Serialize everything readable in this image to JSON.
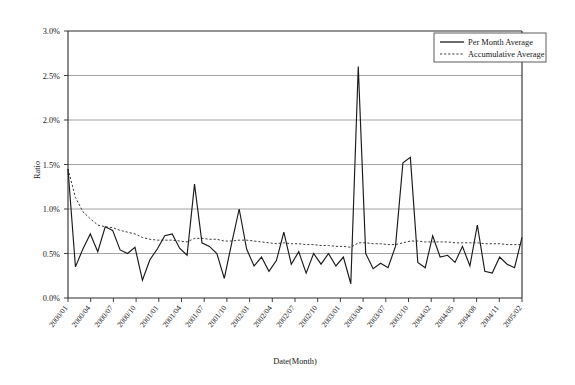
{
  "chart_data": {
    "type": "line",
    "title": "",
    "xlabel": "Date(Month)",
    "ylabel": "Ratio",
    "ylim": [
      0.0,
      3.0
    ],
    "ytick_labels": [
      "0.0%",
      "0.5%",
      "1.0%",
      "1.5%",
      "2.0%",
      "2.5%",
      "3.0%"
    ],
    "ytick_values": [
      0.0,
      0.5,
      1.0,
      1.5,
      2.0,
      2.5,
      3.0
    ],
    "grid": "horizontal",
    "legend_position": "top-right",
    "xtick_labels": [
      "2000/01",
      "2000/04",
      "2000/07",
      "2000/10",
      "2001/01",
      "2001/04",
      "2001/07",
      "2001/10",
      "2002/01",
      "2002/04",
      "2002/07",
      "2002/10",
      "2003/01",
      "2003/04",
      "2003/07",
      "2003/10",
      "2004/02",
      "2004/05",
      "2004/08",
      "2004/11",
      "2005/02"
    ],
    "x": [
      "2000/01",
      "2000/02",
      "2000/03",
      "2000/04",
      "2000/05",
      "2000/06",
      "2000/07",
      "2000/08",
      "2000/09",
      "2000/10",
      "2000/11",
      "2000/12",
      "2001/01",
      "2001/02",
      "2001/03",
      "2001/04",
      "2001/05",
      "2001/06",
      "2001/07",
      "2001/08",
      "2001/09",
      "2001/10",
      "2001/11",
      "2001/12",
      "2002/01",
      "2002/02",
      "2002/03",
      "2002/04",
      "2002/05",
      "2002/06",
      "2002/07",
      "2002/08",
      "2002/09",
      "2002/10",
      "2002/11",
      "2002/12",
      "2003/01",
      "2003/02",
      "2003/03",
      "2003/04",
      "2003/05",
      "2003/06",
      "2003/07",
      "2003/08",
      "2003/09",
      "2003/10",
      "2003/11",
      "2003/12",
      "2004/01",
      "2004/02",
      "2004/03",
      "2004/04",
      "2004/05",
      "2004/06",
      "2004/07",
      "2004/08",
      "2004/09",
      "2004/10",
      "2004/11",
      "2004/12",
      "2005/01",
      "2005/02"
    ],
    "series": [
      {
        "name": "Per Month Average",
        "style": "solid",
        "color": "#1a1a1a",
        "values": [
          1.45,
          0.35,
          0.55,
          0.72,
          0.52,
          0.8,
          0.76,
          0.54,
          0.5,
          0.57,
          0.2,
          0.43,
          0.55,
          0.7,
          0.72,
          0.56,
          0.48,
          1.28,
          0.62,
          0.58,
          0.5,
          0.22,
          0.62,
          1.0,
          0.55,
          0.36,
          0.46,
          0.3,
          0.42,
          0.74,
          0.38,
          0.52,
          0.28,
          0.5,
          0.38,
          0.5,
          0.36,
          0.46,
          0.16,
          2.6,
          0.5,
          0.33,
          0.39,
          0.34,
          0.58,
          1.52,
          1.58,
          0.4,
          0.34,
          0.7,
          0.46,
          0.48,
          0.4,
          0.58,
          0.36,
          0.82,
          0.3,
          0.28,
          0.46,
          0.38,
          0.34,
          0.68
        ]
      },
      {
        "name": "Accumulative Average",
        "style": "dotted",
        "color": "#3d3d3d",
        "values": [
          1.45,
          1.13,
          0.97,
          0.89,
          0.82,
          0.8,
          0.79,
          0.76,
          0.74,
          0.72,
          0.68,
          0.66,
          0.65,
          0.65,
          0.65,
          0.64,
          0.63,
          0.67,
          0.67,
          0.66,
          0.66,
          0.64,
          0.64,
          0.65,
          0.65,
          0.64,
          0.63,
          0.62,
          0.61,
          0.62,
          0.61,
          0.61,
          0.6,
          0.6,
          0.59,
          0.59,
          0.58,
          0.58,
          0.57,
          0.62,
          0.62,
          0.61,
          0.61,
          0.6,
          0.6,
          0.62,
          0.64,
          0.64,
          0.63,
          0.63,
          0.63,
          0.63,
          0.62,
          0.62,
          0.62,
          0.62,
          0.61,
          0.61,
          0.61,
          0.6,
          0.6,
          0.6
        ]
      }
    ]
  },
  "legend": {
    "entries": [
      {
        "label": "Per Month Average"
      },
      {
        "label": "Accumulative  Average"
      }
    ]
  },
  "axes": {
    "y_title": "Ratio",
    "x_title": "Date(Month)"
  }
}
